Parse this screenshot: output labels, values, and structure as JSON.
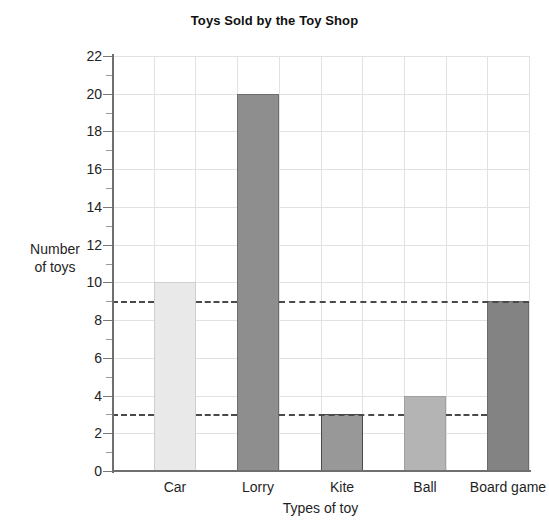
{
  "scan": {
    "top_sliver_text": ""
  },
  "chart_data": {
    "type": "bar",
    "title": "Toys Sold by the Toy Shop",
    "xlabel": "Types of toy",
    "ylabel_line1": "Number",
    "ylabel_line2": "of toys",
    "ylabel": "Number of toys",
    "categories": [
      "Car",
      "Lorry",
      "Kite",
      "Ball",
      "Board game"
    ],
    "values": [
      10,
      20,
      3,
      4,
      9
    ],
    "bar_colors": [
      "#e9e9e9",
      "#8e8e8e",
      "#989898",
      "#b4b4b4",
      "#838383"
    ],
    "bar_border_colors": [
      "#cfcfcf",
      "#6d6d6d",
      "#4a4a4a",
      "#a0a0a0",
      "#6a6a6a"
    ],
    "ylim": [
      0,
      22
    ],
    "ytick_labels": [
      "0",
      "2",
      "4",
      "6",
      "8",
      "10",
      "12",
      "14",
      "16",
      "18",
      "20",
      "22"
    ],
    "ytick_values": [
      0,
      2,
      4,
      6,
      8,
      10,
      12,
      14,
      16,
      18,
      20,
      22
    ],
    "yminor_values": [
      1,
      3,
      5,
      7,
      9,
      11,
      13,
      15,
      17,
      19,
      21
    ],
    "grid": true,
    "grid_color": "#e2e2e2",
    "legend": "none",
    "reference_lines": [
      {
        "value": 9,
        "style": "dashed",
        "color": "#4a4a4a"
      },
      {
        "value": 3,
        "style": "dashed",
        "color": "#4a4a4a"
      }
    ],
    "axis_color": "#6f6f6f"
  }
}
